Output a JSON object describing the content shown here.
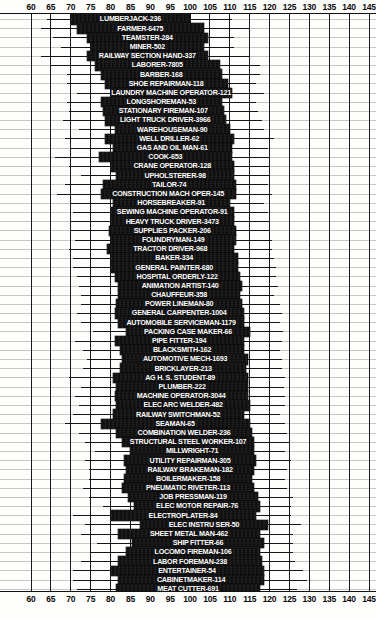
{
  "chart_data": {
    "type": "bar",
    "title": "",
    "xlabel": "",
    "ylabel": "",
    "xlim": [
      60,
      145
    ],
    "grid": true,
    "legend": null,
    "orientation": "horizontal",
    "axis_ticks": [
      60,
      65,
      70,
      75,
      80,
      85,
      90,
      95,
      100,
      105,
      110,
      115,
      120,
      125,
      130,
      135,
      140,
      145
    ],
    "categories": [
      "LUMBERJACK-236",
      "FARMER-6475",
      "TEAMSTER-284",
      "MINER-502",
      "RAILWAY SECTION HAND-337",
      "LABORER-7805",
      "BARBER-168",
      "SHOE REPAIRMAN-118",
      "LAUNDRY MACHINE OPERATOR-121",
      "LONGSHOREMAN-53",
      "STATIONARY FIREMAN-107",
      "LIGHT TRUCK DRIVER-3966",
      "WAREHOUSEMAN-90",
      "WELL DRILLER-62",
      "GAS AND OIL MAN-61",
      "COOK-653",
      "CRANE OPERATOR-128",
      "UPHOLSTERER-98",
      "TAILOR-74",
      "CONSTRUCTION MACH OPER-145",
      "HORSEBREAKER-91",
      "SEWING MACHINE OPERATOR-91",
      "HEAVY TRUCK DRIVER-3473",
      "SUPPLIES PACKER-206",
      "FOUNDRYMAN-149",
      "TRACTOR DRIVER-968",
      "BAKER-334",
      "GENERAL PAINTER-680",
      "HOSPITAL ORDERLY-122",
      "ANIMATION ARTIST-140",
      "CHAUFFEUR-358",
      "POWER LINEMAN-80",
      "GENERAL CARPENTER-1004",
      "AUTOMOBILE SERVICEMAN-1179",
      "PACKING CASE MAKER-66",
      "PIPE FITTER-194",
      "BLACKSMITH-162",
      "AUTOMOTIVE MECH-1693",
      "BRICKLAYER-213",
      "AG H. S. STUDENT-89",
      "PLUMBER-222",
      "MACHINE OPERATOR-3044",
      "ELEC ARC WELDER-482",
      "RAILWAY SWITCHMAN-52",
      "SEAMAN-65",
      "COMBINATION WELDER-236",
      "STRUCTURAL STEEL WORKER-107",
      "MILLWRIGHT-71",
      "UTILITY REPAIRMAN-305",
      "RAILWAY BRAKEMAN-182",
      "BOILERMAKER-158",
      "PNEUMATIC RIVETER-113",
      "JOB PRESSMAN-119",
      "ELEC MOTOR REPAIR-76",
      "ELECTROPLATER-84",
      "ELEC INSTRU SER-50",
      "SHEET METAL MAN-462",
      "SHIP FITTER-66",
      "LOCOMO FIREMAN-106",
      "LABOR FOREMAN-238",
      "ENTERTAINER-54",
      "CABINETMAKER-114",
      "MEAT CUTTER-691"
    ],
    "series": [
      {
        "name": "score range (whisker) and middle range (box)",
        "rows": [
          {
            "label": "LUMBERJACK-236",
            "n": 236,
            "whisker_low": 64.0,
            "whisker_high": 110.5,
            "box_low": 70.0,
            "box_high": 100.0
          },
          {
            "label": "FARMER-6475",
            "n": 6475,
            "whisker_low": 62.5,
            "whisker_high": 115.0,
            "box_low": 71.5,
            "box_high": 103.5
          },
          {
            "label": "TEAMSTER-284",
            "n": 284,
            "whisker_low": 65.5,
            "whisker_high": 111.0,
            "box_low": 74.0,
            "box_high": 104.5
          },
          {
            "label": "MINER-502",
            "n": 502,
            "whisker_low": 67.5,
            "whisker_high": 111.0,
            "box_low": 75.0,
            "box_high": 103.5
          },
          {
            "label": "RAILWAY SECTION HAND-337",
            "n": 337,
            "whisker_low": 62.5,
            "whisker_high": 115.0,
            "box_low": 74.0,
            "box_high": 104.5
          },
          {
            "label": "LABORER-7805",
            "n": 7805,
            "whisker_low": 65.0,
            "whisker_high": 117.5,
            "box_low": 76.0,
            "box_high": 107.5
          },
          {
            "label": "BARBER-168",
            "n": 168,
            "whisker_low": 69.0,
            "whisker_high": 117.5,
            "box_low": 77.5,
            "box_high": 108.0
          },
          {
            "label": "SHOE REPAIRMAN-118",
            "n": 118,
            "whisker_low": 69.0,
            "whisker_high": 116.5,
            "box_low": 78.5,
            "box_high": 109.5
          },
          {
            "label": "LAUNDRY MACHINE OPERATOR-121",
            "n": 121,
            "whisker_low": 71.5,
            "whisker_high": 118.5,
            "box_low": 80.0,
            "box_high": 110.5
          },
          {
            "label": "LONGSHOREMAN-53",
            "n": 53,
            "whisker_low": 69.0,
            "whisker_high": 116.5,
            "box_low": 77.5,
            "box_high": 108.0
          },
          {
            "label": "STATIONARY FIREMAN-107",
            "n": 107,
            "whisker_low": 69.5,
            "whisker_high": 117.0,
            "box_low": 78.0,
            "box_high": 108.5
          },
          {
            "label": "LIGHT TRUCK DRIVER-3966",
            "n": 3966,
            "whisker_low": 68.0,
            "whisker_high": 118.0,
            "box_low": 78.5,
            "box_high": 109.0
          },
          {
            "label": "WAREHOUSEMAN-90",
            "n": 90,
            "whisker_low": 72.0,
            "whisker_high": 118.5,
            "box_low": 81.0,
            "box_high": 110.0
          },
          {
            "label": "WELL DRILLER-62",
            "n": 62,
            "whisker_low": 68.5,
            "whisker_high": 121.0,
            "box_low": 78.5,
            "box_high": 111.0
          },
          {
            "label": "GAS AND OIL MAN-61",
            "n": 61,
            "whisker_low": 70.0,
            "whisker_high": 119.5,
            "box_low": 80.5,
            "box_high": 110.5
          },
          {
            "label": "COOK-653",
            "n": 653,
            "whisker_low": 66.0,
            "whisker_high": 120.0,
            "box_low": 77.0,
            "box_high": 110.5
          },
          {
            "label": "CRANE OPERATOR-128",
            "n": 128,
            "whisker_low": 69.5,
            "whisker_high": 120.0,
            "box_low": 80.0,
            "box_high": 111.0
          },
          {
            "label": "UPHOLSTERER-98",
            "n": 98,
            "whisker_low": 72.5,
            "whisker_high": 120.0,
            "box_low": 81.5,
            "box_high": 111.0
          },
          {
            "label": "TAILOR-74",
            "n": 74,
            "whisker_low": 68.5,
            "whisker_high": 119.5,
            "box_low": 78.0,
            "box_high": 111.5
          },
          {
            "label": "CONSTRUCTION MACH OPER-145",
            "n": 145,
            "whisker_low": 66.5,
            "whisker_high": 120.5,
            "box_low": 77.5,
            "box_high": 111.5
          },
          {
            "label": "HORSEBREAKER-91",
            "n": 91,
            "whisker_low": 70.0,
            "whisker_high": 118.5,
            "box_low": 80.5,
            "box_high": 110.0
          },
          {
            "label": "SEWING MACHINE OPERATOR-91",
            "n": 91,
            "whisker_low": 70.5,
            "whisker_high": 119.5,
            "box_low": 80.0,
            "box_high": 111.0
          },
          {
            "label": "HEAVY TRUCK DRIVER-3473",
            "n": 3473,
            "whisker_low": 70.0,
            "whisker_high": 120.0,
            "box_low": 80.0,
            "box_high": 111.0
          },
          {
            "label": "SUPPLIES PACKER-206",
            "n": 206,
            "whisker_low": 70.0,
            "whisker_high": 120.0,
            "box_low": 79.5,
            "box_high": 111.5
          },
          {
            "label": "FOUNDRYMAN-149",
            "n": 149,
            "whisker_low": 71.0,
            "whisker_high": 120.5,
            "box_low": 80.0,
            "box_high": 111.5
          },
          {
            "label": "TRACTOR DRIVER-968",
            "n": 968,
            "whisker_low": 69.5,
            "whisker_high": 120.5,
            "box_low": 79.0,
            "box_high": 111.0
          },
          {
            "label": "BAKER-334",
            "n": 334,
            "whisker_low": 70.5,
            "whisker_high": 121.0,
            "box_low": 80.0,
            "box_high": 112.0
          },
          {
            "label": "GENERAL PAINTER-680",
            "n": 680,
            "whisker_low": 70.5,
            "whisker_high": 121.5,
            "box_low": 80.0,
            "box_high": 112.0
          },
          {
            "label": "HOSPITAL ORDERLY-122",
            "n": 122,
            "whisker_low": 71.5,
            "whisker_high": 121.5,
            "box_low": 81.0,
            "box_high": 112.5
          },
          {
            "label": "ANIMATION ARTIST-140",
            "n": 140,
            "whisker_low": 72.0,
            "whisker_high": 122.0,
            "box_low": 82.0,
            "box_high": 113.0
          },
          {
            "label": "CHAUFFEUR-358",
            "n": 358,
            "whisker_low": 72.5,
            "whisker_high": 121.0,
            "box_low": 82.0,
            "box_high": 112.5
          },
          {
            "label": "POWER LINEMAN-80",
            "n": 80,
            "whisker_low": 72.5,
            "whisker_high": 122.5,
            "box_low": 81.5,
            "box_high": 113.0
          },
          {
            "label": "GENERAL CARPENTER-1004",
            "n": 1004,
            "whisker_low": 71.5,
            "whisker_high": 123.0,
            "box_low": 81.0,
            "box_high": 113.5
          },
          {
            "label": "AUTOMOBILE SERVICEMAN-1179",
            "n": 1179,
            "whisker_low": 72.5,
            "whisker_high": 122.5,
            "box_low": 82.0,
            "box_high": 113.5
          },
          {
            "label": "PACKING CASE MAKER-66",
            "n": 66,
            "whisker_low": 75.5,
            "whisker_high": 123.5,
            "box_low": 84.0,
            "box_high": 115.0
          },
          {
            "label": "PIPE FITTER-194",
            "n": 194,
            "whisker_low": 71.0,
            "whisker_high": 123.0,
            "box_low": 81.0,
            "box_high": 113.5
          },
          {
            "label": "BLACKSMITH-162",
            "n": 162,
            "whisker_low": 73.0,
            "whisker_high": 122.5,
            "box_low": 82.5,
            "box_high": 113.5
          },
          {
            "label": "AUTOMOTIVE MECH-1693",
            "n": 1693,
            "whisker_low": 74.0,
            "whisker_high": 123.0,
            "box_low": 83.0,
            "box_high": 114.5
          },
          {
            "label": "BRICKLAYER-213",
            "n": 213,
            "whisker_low": 73.0,
            "whisker_high": 123.0,
            "box_low": 82.5,
            "box_high": 114.0
          },
          {
            "label": "AG H. S. STUDENT-89",
            "n": 89,
            "whisker_low": 69.5,
            "whisker_high": 124.0,
            "box_low": 80.5,
            "box_high": 114.5
          },
          {
            "label": "PLUMBER-222",
            "n": 222,
            "whisker_low": 72.5,
            "whisker_high": 123.5,
            "box_low": 81.5,
            "box_high": 114.5
          },
          {
            "label": "MACHINE OPERATOR-3044",
            "n": 3044,
            "whisker_low": 71.0,
            "whisker_high": 124.0,
            "box_low": 81.0,
            "box_high": 114.5
          },
          {
            "label": "ELEC ARC WELDER-482",
            "n": 482,
            "whisker_low": 72.0,
            "whisker_high": 124.0,
            "box_low": 81.5,
            "box_high": 115.0
          },
          {
            "label": "RAILWAY SWITCHMAN-52",
            "n": 52,
            "whisker_low": 70.5,
            "whisker_high": 122.5,
            "box_low": 80.5,
            "box_high": 113.5
          },
          {
            "label": "SEAMAN-65",
            "n": 65,
            "whisker_low": 68.5,
            "whisker_high": 124.0,
            "box_low": 77.5,
            "box_high": 115.0
          },
          {
            "label": "COMBINATION WELDER-236",
            "n": 236,
            "whisker_low": 72.0,
            "whisker_high": 124.5,
            "box_low": 81.5,
            "box_high": 115.5
          },
          {
            "label": "STRUCTURAL STEEL WORKER-107",
            "n": 107,
            "whisker_low": 73.5,
            "whisker_high": 125.0,
            "box_low": 83.0,
            "box_high": 116.0
          },
          {
            "label": "MILLWRIGHT-71",
            "n": 71,
            "whisker_low": 76.0,
            "whisker_high": 124.0,
            "box_low": 85.0,
            "box_high": 116.0
          },
          {
            "label": "UTILITY REPAIRMAN-305",
            "n": 305,
            "whisker_low": 73.5,
            "whisker_high": 125.5,
            "box_low": 83.5,
            "box_high": 116.5
          },
          {
            "label": "RAILWAY BRAKEMAN-182",
            "n": 182,
            "whisker_low": 74.5,
            "whisker_high": 124.5,
            "box_low": 84.0,
            "box_high": 116.0
          },
          {
            "label": "BOILERMAKER-158",
            "n": 158,
            "whisker_low": 74.5,
            "whisker_high": 124.0,
            "box_low": 83.5,
            "box_high": 115.5
          },
          {
            "label": "PNEUMATIC RIVETER-113",
            "n": 113,
            "whisker_low": 73.0,
            "whisker_high": 124.5,
            "box_low": 83.0,
            "box_high": 116.0
          },
          {
            "label": "JOB PRESSMAN-119",
            "n": 119,
            "whisker_low": 74.5,
            "whisker_high": 126.0,
            "box_low": 84.5,
            "box_high": 117.0
          },
          {
            "label": "ELEC MOTOR REPAIR-76",
            "n": 76,
            "whisker_low": 78.0,
            "whisker_high": 125.5,
            "box_low": 86.0,
            "box_high": 117.5
          },
          {
            "label": "ELECTROPLATER-84",
            "n": 84,
            "whisker_low": 70.5,
            "whisker_high": 125.5,
            "box_low": 80.0,
            "box_high": 116.5
          },
          {
            "label": "ELEC INSTRU SER-50",
            "n": 50,
            "whisker_low": 73.5,
            "whisker_high": 128.0,
            "box_low": 87.5,
            "box_high": 119.5
          },
          {
            "label": "SHEET METAL MAN-462",
            "n": 462,
            "whisker_low": 72.5,
            "whisker_high": 126.0,
            "box_low": 82.0,
            "box_high": 117.5
          },
          {
            "label": "SHIP FITTER-66",
            "n": 66,
            "whisker_low": 76.5,
            "whisker_high": 126.0,
            "box_low": 85.5,
            "box_high": 118.5
          },
          {
            "label": "LOCOMO FIREMAN-106",
            "n": 106,
            "whisker_low": 75.0,
            "whisker_high": 126.0,
            "box_low": 84.0,
            "box_high": 117.5
          },
          {
            "label": "LABOR FOREMAN-238",
            "n": 238,
            "whisker_low": 72.5,
            "whisker_high": 126.5,
            "box_low": 82.0,
            "box_high": 118.0
          },
          {
            "label": "ENTERTAINER-54",
            "n": 54,
            "whisker_low": 70.5,
            "whisker_high": 128.5,
            "box_low": 80.0,
            "box_high": 118.5
          },
          {
            "label": "CABINETMAKER-114",
            "n": 114,
            "whisker_low": 70.5,
            "whisker_high": 129.5,
            "box_low": 82.0,
            "box_high": 118.5
          },
          {
            "label": "MEAT CUTTER-691",
            "n": 691,
            "whisker_low": 71.5,
            "whisker_high": 127.0,
            "box_low": 81.5,
            "box_high": 117.5
          }
        ]
      }
    ]
  },
  "colors": {
    "bar": "#0d0d0d",
    "grid": "#1a1a1a",
    "background": "#fdfdfb",
    "label_text": "#ffffff",
    "axis_text": "#0a0a0a"
  }
}
